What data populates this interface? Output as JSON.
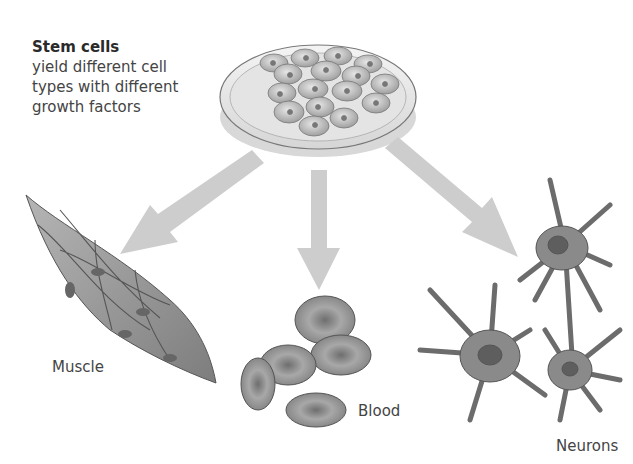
{
  "caption": {
    "title": "Stem cells",
    "lines": [
      "yield different cell",
      "types with different",
      "growth factors"
    ]
  },
  "source": {
    "name": "petri-dish-stem-cells"
  },
  "outputs": [
    {
      "label": "Muscle"
    },
    {
      "label": "Blood"
    },
    {
      "label": "Neurons"
    }
  ],
  "colors": {
    "arrow": "#c9c9c9",
    "cell": "#8a8a8a",
    "text": "#444444"
  }
}
